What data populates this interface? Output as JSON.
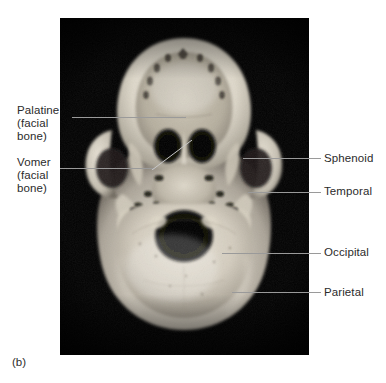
{
  "figure": {
    "caption": "(b)",
    "view_description": "Inferior view of the skull (skull base), photograph",
    "background_color": "#ffffff",
    "photo_background_color": "#000000",
    "leader_line_color": "#9a9a9a",
    "text_color": "#2b2b2b"
  },
  "labels": {
    "palatine": {
      "line1": "Palatine",
      "line2": "(facial",
      "line3": "bone)",
      "side": "left"
    },
    "vomer": {
      "line1": "Vomer",
      "line2": "(facial",
      "line3": "bone)",
      "side": "left"
    },
    "sphenoid": {
      "line1": "Sphenoid",
      "side": "right"
    },
    "temporal": {
      "line1": "Temporal",
      "side": "right"
    },
    "occipital": {
      "line1": "Occipital",
      "side": "right"
    },
    "parietal": {
      "line1": "Parietal",
      "side": "right"
    }
  }
}
